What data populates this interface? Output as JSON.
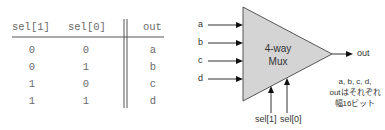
{
  "truth_table": {
    "headers": [
      "sel[1]",
      "sel[0]",
      "out"
    ],
    "rows": [
      [
        "0",
        "0",
        "a"
      ],
      [
        "0",
        "1",
        "b"
      ],
      [
        "1",
        "0",
        "c"
      ],
      [
        "1",
        "1",
        "d"
      ]
    ]
  },
  "mux": {
    "title_line1": "4-way",
    "title_line2": "Mux",
    "fill_color": "#d4d4d4",
    "inputs": [
      "a",
      "b",
      "c",
      "d"
    ],
    "output": "out",
    "selects": [
      "sel[1]",
      "sel[0]"
    ],
    "note_lines": [
      "a, b, c, d,",
      "outはそれぞれ",
      "幅16ビット"
    ]
  }
}
